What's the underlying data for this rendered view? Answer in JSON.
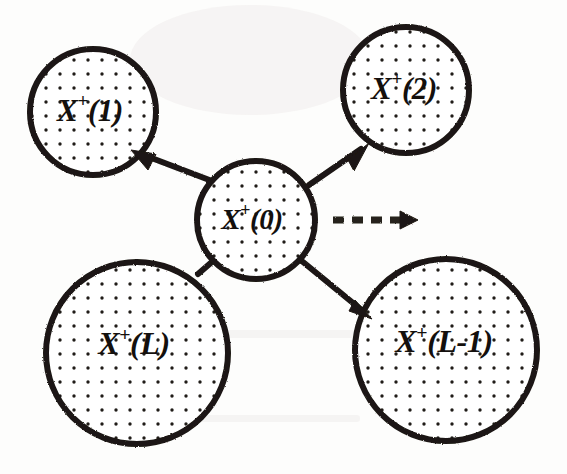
{
  "figure": {
    "background_color": "#fdfdfc",
    "ink_color": "#1b1713",
    "fill_pattern": "dotted-stipple",
    "dot_color": "#201c18"
  },
  "nodes": [
    {
      "id": "x-plus-1",
      "base": "X",
      "superscript": "+",
      "arg": "(1)",
      "full_label": "X+(1)",
      "cx": 93,
      "cy": 112,
      "r": 64,
      "font_size": 31
    },
    {
      "id": "x-plus-2",
      "base": "X",
      "superscript": "+",
      "arg": "(2)",
      "full_label": "X+(2)",
      "cx": 406,
      "cy": 90,
      "r": 64,
      "font_size": 31
    },
    {
      "id": "x-plus-0",
      "base": "X",
      "superscript": "+",
      "arg": "(0)",
      "full_label": "X+(0)",
      "cx": 256,
      "cy": 220,
      "r": 60,
      "font_size": 29
    },
    {
      "id": "x-plus-l",
      "base": "X",
      "superscript": "+",
      "arg": "(L)",
      "full_label": "X+(L)",
      "cx": 137,
      "cy": 353,
      "r": 92,
      "font_size": 32
    },
    {
      "id": "x-plus-l-minus-1",
      "base": "X",
      "superscript": "+",
      "arg": "(L-1)",
      "full_label": "X+(L-1)",
      "cx": 446,
      "cy": 350,
      "r": 92,
      "font_size": 32
    }
  ],
  "edges": [
    {
      "id": "edge-center-to-1",
      "from": "x-plus-0",
      "to": "x-plus-1",
      "style": "solid",
      "arrow": "to-target",
      "x1": 212,
      "y1": 181,
      "x2": 141,
      "y2": 154
    },
    {
      "id": "edge-center-to-2",
      "from": "x-plus-0",
      "to": "x-plus-2",
      "style": "solid",
      "arrow": "to-target",
      "x1": 309,
      "y1": 185,
      "x2": 361,
      "y2": 149
    },
    {
      "id": "edge-center-to-l-minus-1",
      "from": "x-plus-0",
      "to": "x-plus-l-minus-1",
      "style": "solid",
      "arrow": "to-target",
      "x1": 303,
      "y1": 262,
      "x2": 364,
      "y2": 312
    },
    {
      "id": "edge-center-to-l",
      "from": "x-plus-0",
      "to": "x-plus-l",
      "style": "solid",
      "arrow": "none",
      "x1": 212,
      "y1": 261,
      "x2": 199,
      "y2": 273
    },
    {
      "id": "edge-center-outward",
      "from": "x-plus-0",
      "to": "off-figure",
      "style": "dashed",
      "arrow": "to-target",
      "x1": 331,
      "y1": 220,
      "x2": 415,
      "y2": 220,
      "dash_pattern": "10 7"
    }
  ]
}
